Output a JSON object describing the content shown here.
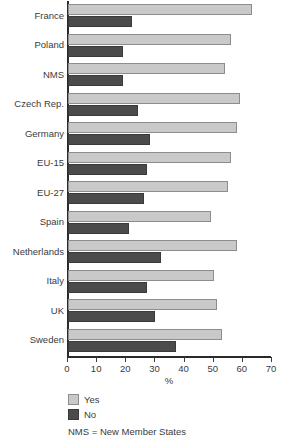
{
  "chart_data": {
    "type": "bar",
    "orientation": "horizontal",
    "title": "",
    "xlabel": "%",
    "ylabel": "",
    "xlim": [
      0,
      70
    ],
    "xticks": [
      0,
      10,
      20,
      30,
      40,
      50,
      60,
      70
    ],
    "grid": false,
    "legend_position": "below-axis-left",
    "categories": [
      "France",
      "Poland",
      "NMS",
      "Czech Rep.",
      "Germany",
      "EU-15",
      "EU-27",
      "Spain",
      "Netherlands",
      "Italy",
      "UK",
      "Sweden"
    ],
    "series": [
      {
        "name": "Yes",
        "color": "#c9c9c9",
        "values": [
          63,
          56,
          54,
          59,
          58,
          56,
          55,
          49,
          58,
          50,
          51,
          53
        ]
      },
      {
        "name": "No",
        "color": "#4b4b4b",
        "values": [
          22,
          19,
          19,
          24,
          28,
          27,
          26,
          21,
          32,
          27,
          30,
          37
        ]
      }
    ],
    "annotations": [
      "NMS = New Member States"
    ]
  },
  "legend": {
    "items": [
      {
        "label": "Yes"
      },
      {
        "label": "No"
      }
    ],
    "note": "NMS = New Member States"
  },
  "axis": {
    "x_title": "%"
  }
}
